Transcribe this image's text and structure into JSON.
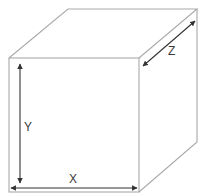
{
  "diagram": {
    "type": "cube-dimensions",
    "labels": {
      "x": "X",
      "y": "Y",
      "z": "Z"
    },
    "colors": {
      "edge": "#a9a9a9",
      "arrow": "#333333",
      "background": "#ffffff"
    }
  }
}
